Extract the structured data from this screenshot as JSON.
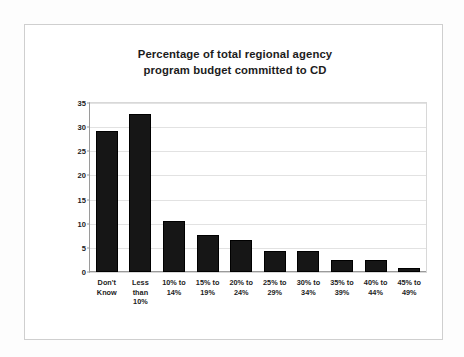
{
  "chart_data": {
    "type": "bar",
    "title": "Percentage of total regional agency program budget committed to CD",
    "title_lines": [
      "Percentage of total regional agency",
      "program budget committed to CD"
    ],
    "xlabel": "",
    "ylabel": "Percentage of Agencies",
    "ylim": [
      0,
      35
    ],
    "yticks": [
      0,
      5,
      10,
      15,
      20,
      25,
      30,
      35
    ],
    "ytick_labels": [
      "0",
      "5",
      "10",
      "15",
      "20",
      "25",
      "30",
      "35"
    ],
    "grid": "horizontal",
    "legend": "none",
    "categories": [
      "Don't Know",
      "Less than 10%",
      "10% to 14%",
      "15% to 19%",
      "20% to 24%",
      "25% to 29%",
      "30% to 34%",
      "35% to 39%",
      "40% to 44%",
      "45% to 49%"
    ],
    "category_lines": [
      [
        "Don't",
        "Know"
      ],
      [
        "Less",
        "than",
        "10%"
      ],
      [
        "10% to",
        "14%"
      ],
      [
        "15% to",
        "19%"
      ],
      [
        "20% to",
        "24%"
      ],
      [
        "25% to",
        "29%"
      ],
      [
        "30% to",
        "34%"
      ],
      [
        "35% to",
        "39%"
      ],
      [
        "40% to",
        "44%"
      ],
      [
        "45% to",
        "49%"
      ]
    ],
    "values": [
      29.2,
      32.8,
      10.6,
      7.7,
      6.6,
      4.4,
      4.3,
      2.5,
      2.4,
      0.8
    ],
    "bar_color": "#161616",
    "plot_background": "#ffffff",
    "gridline_color": "#e2e2e2",
    "axis_color": "#9a9a9a"
  }
}
